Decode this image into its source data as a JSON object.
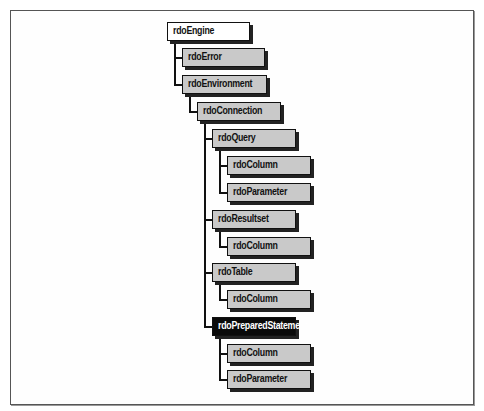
{
  "diagram": {
    "type": "object-hierarchy",
    "nodes": [
      {
        "id": "engine",
        "label": "rdoEngine",
        "style": "root",
        "x": 167,
        "y": 22,
        "w": 81
      },
      {
        "id": "error",
        "label": "rdoError",
        "style": "normal",
        "x": 182,
        "y": 48,
        "w": 81
      },
      {
        "id": "environment",
        "label": "rdoEnvironment",
        "style": "normal",
        "x": 182,
        "y": 75,
        "w": 83
      },
      {
        "id": "connection",
        "label": "rdoConnection",
        "style": "normal",
        "x": 197,
        "y": 102,
        "w": 82
      },
      {
        "id": "query",
        "label": "rdoQuery",
        "style": "normal",
        "x": 212,
        "y": 129,
        "w": 82
      },
      {
        "id": "query_column",
        "label": "rdoColumn",
        "style": "normal",
        "x": 227,
        "y": 156,
        "w": 82
      },
      {
        "id": "query_parameter",
        "label": "rdoParameter",
        "style": "normal",
        "x": 227,
        "y": 183,
        "w": 82
      },
      {
        "id": "resultset",
        "label": "rdoResultset",
        "style": "normal",
        "x": 212,
        "y": 210,
        "w": 82
      },
      {
        "id": "resultset_column",
        "label": "rdoColumn",
        "style": "normal",
        "x": 227,
        "y": 237,
        "w": 82
      },
      {
        "id": "table",
        "label": "rdoTable",
        "style": "normal",
        "x": 212,
        "y": 263,
        "w": 82
      },
      {
        "id": "table_column",
        "label": "rdoColumn",
        "style": "normal",
        "x": 227,
        "y": 290,
        "w": 82
      },
      {
        "id": "prepared",
        "label": "rdoPreparedStatement",
        "style": "dark",
        "x": 212,
        "y": 317,
        "w": 82
      },
      {
        "id": "prepared_column",
        "label": "rdoColumn",
        "style": "normal",
        "x": 227,
        "y": 344,
        "w": 82
      },
      {
        "id": "prepared_parameter",
        "label": "rdoParameter",
        "style": "normal",
        "x": 227,
        "y": 370,
        "w": 82
      }
    ],
    "edges": [
      [
        "engine",
        "error"
      ],
      [
        "engine",
        "environment"
      ],
      [
        "environment",
        "connection"
      ],
      [
        "connection",
        "query"
      ],
      [
        "query",
        "query_column"
      ],
      [
        "query",
        "query_parameter"
      ],
      [
        "connection",
        "resultset"
      ],
      [
        "resultset",
        "resultset_column"
      ],
      [
        "connection",
        "table"
      ],
      [
        "table",
        "table_column"
      ],
      [
        "connection",
        "prepared"
      ],
      [
        "prepared",
        "prepared_column"
      ],
      [
        "prepared",
        "prepared_parameter"
      ]
    ],
    "colors": {
      "node_fill": "#c9c9c9",
      "root_fill": "#ffffff",
      "highlight_fill": "#0a0a0a",
      "highlight_text": "#ffffff",
      "border": "#111111",
      "shadow": "#222222"
    }
  }
}
